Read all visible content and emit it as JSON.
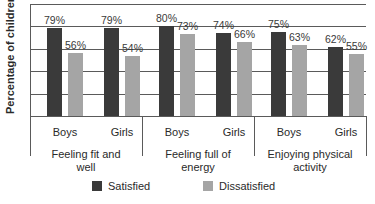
{
  "chart_data": {
    "type": "bar",
    "title": "",
    "xlabel": "",
    "ylabel": "Percentage of children",
    "ylim": [
      0,
      100
    ],
    "grid": true,
    "gridlines": [
      0,
      20,
      40,
      60,
      80,
      100
    ],
    "y_tick_labels_visible": false,
    "legend_position": "bottom",
    "groups": [
      {
        "label": "Feeling fit and well",
        "label_lines": [
          "Feeling fit and",
          "well"
        ],
        "subcategories": [
          "Boys",
          "Girls"
        ]
      },
      {
        "label": "Feeling full of energy",
        "label_lines": [
          "Feeling full of",
          "energy"
        ],
        "subcategories": [
          "Boys",
          "Girls"
        ]
      },
      {
        "label": "Enjoying physical activity",
        "label_lines": [
          "Enjoying physical",
          "activity"
        ],
        "subcategories": [
          "Boys",
          "Girls"
        ]
      }
    ],
    "categories": [
      "Feeling fit and well - Boys",
      "Feeling fit and well - Girls",
      "Feeling full of energy - Boys",
      "Feeling full of energy - Girls",
      "Enjoying physical activity - Boys",
      "Enjoying physical activity - Girls"
    ],
    "series": [
      {
        "name": "Satisfied",
        "color": "#3a3a3a",
        "values": [
          79,
          79,
          80,
          74,
          75,
          62
        ],
        "labels": [
          "79%",
          "79%",
          "80%",
          "74%",
          "75%",
          "62%"
        ]
      },
      {
        "name": "Dissatisfied",
        "color": "#a5a5a5",
        "values": [
          56,
          54,
          73,
          66,
          63,
          55
        ],
        "labels": [
          "56%",
          "54%",
          "73%",
          "66%",
          "63%",
          "55%"
        ]
      }
    ]
  },
  "legend": {
    "satisfied": "Satisfied",
    "dissatisfied": "Dissatisfied"
  }
}
